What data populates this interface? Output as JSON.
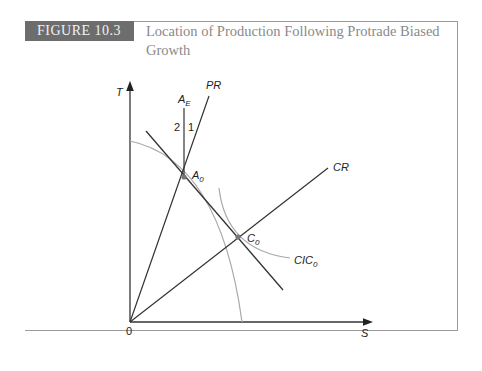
{
  "figure": {
    "tag": "FIGURE 10.3",
    "title": "Location of Production Following Protrade Biased Growth"
  },
  "diagram": {
    "axes": {
      "y_label": "T",
      "x_label": "S",
      "origin_label": "0"
    },
    "lines": {
      "pr": "PR",
      "cr": "CR",
      "ae": "A",
      "ae_sub": "E"
    },
    "points": {
      "a0": "A",
      "a0_sub": "0",
      "c0": "C",
      "c0_sub": "0"
    },
    "curves": {
      "cic": "CIC",
      "cic_sub": "0"
    },
    "regions": {
      "left": "2",
      "right": "1"
    }
  },
  "colors": {
    "tag_bg": "#6d6d6d",
    "title": "#8a8a8a",
    "curve": "#a8a8a8",
    "line": "#333333"
  }
}
